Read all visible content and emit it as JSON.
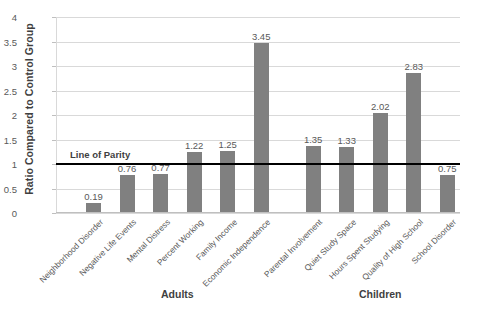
{
  "chart_data": {
    "type": "bar",
    "title": "",
    "xlabel": "",
    "ylabel": "Ratio Compared to Control Group",
    "ylim": [
      0,
      4
    ],
    "ytick_labels": [
      "0",
      "0.5",
      "1",
      "1.5",
      "2",
      "2.5",
      "3",
      "3.5",
      "4"
    ],
    "ytick_values": [
      0,
      0.5,
      1,
      1.5,
      2,
      2.5,
      3,
      3.5,
      4
    ],
    "grid": true,
    "legend": "none",
    "bar_color": "#808080",
    "label_color": "#595959",
    "gridline_color": "#d9d9d9",
    "categories": [
      "Neighborhood Disorder",
      "Negative Life Events",
      "Mental Distress",
      "Percent Working",
      "Family Income",
      "Economic Independence",
      "Parental Involvement",
      "Quiet Study Space",
      "Hours Spent Studying",
      "Quality of High School",
      "School Disorder"
    ],
    "values": [
      0.19,
      0.76,
      0.77,
      1.22,
      1.25,
      3.45,
      1.35,
      1.33,
      2.02,
      2.83,
      0.75
    ],
    "value_labels": [
      "0.19",
      "0.76",
      "0.77",
      "1.22",
      "1.25",
      "3.45",
      "1.35",
      "1.33",
      "2.02",
      "2.83",
      "0.75"
    ],
    "groups": [
      {
        "label": "Adults",
        "categories": [
          "Neighborhood Disorder",
          "Negative Life Events",
          "Mental Distress",
          "Percent Working",
          "Family Income",
          "Economic Independence"
        ]
      },
      {
        "label": "Children",
        "categories": [
          "Parental Involvement",
          "Quiet Study Space",
          "Hours Spent Studying",
          "Quality of High School",
          "School Disorder"
        ]
      }
    ],
    "annotations": [
      {
        "name": "line-of-parity",
        "label": "Line of Parity",
        "y_value": 1,
        "color": "#000000"
      }
    ]
  }
}
